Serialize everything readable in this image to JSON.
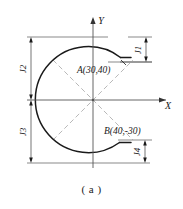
{
  "figure": {
    "caption": "( a )",
    "axes": {
      "x_label": "X",
      "y_label": "Y"
    },
    "points": [
      {
        "id": "A",
        "label": "A(30,40)",
        "x": 30,
        "y": 40
      },
      {
        "id": "B",
        "label": "B(40,-30)",
        "x": 40,
        "y": -30
      }
    ],
    "dimensions": [
      {
        "id": "J1",
        "label": "J1",
        "orientation": "vertical",
        "side": "right-top"
      },
      {
        "id": "J2",
        "label": "J2",
        "orientation": "vertical",
        "side": "left-upper"
      },
      {
        "id": "J3",
        "label": "J3",
        "orientation": "vertical",
        "side": "left-lower"
      },
      {
        "id": "J4",
        "label": "J4",
        "orientation": "vertical",
        "side": "right-bottom"
      }
    ],
    "colors": {
      "outline": "#1a1a1a",
      "axis": "#555555",
      "centerline": "#9a9a9a",
      "dimension": "#3a3a3a",
      "background": "#ffffff"
    }
  }
}
